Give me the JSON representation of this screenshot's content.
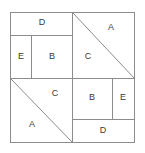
{
  "figure": {
    "background_color": "#ffffff",
    "line_color": "#8c8c8c",
    "label_color": "#3a3a3a",
    "frame": {
      "x": 10,
      "y": 12,
      "width": 125,
      "height": 131
    },
    "center": {
      "x": 72,
      "y": 78
    }
  },
  "quadrants": [
    {
      "name": "top-left",
      "pieces": [
        {
          "id": "tl-D",
          "label": "D",
          "x": 42,
          "y": 23
        },
        {
          "id": "tl-E",
          "label": "E",
          "x": 21,
          "y": 57
        },
        {
          "id": "tl-B",
          "label": "B",
          "x": 52,
          "y": 57
        }
      ]
    },
    {
      "name": "top-right",
      "pieces": [
        {
          "id": "tr-A",
          "label": "A",
          "x": 111,
          "y": 28
        },
        {
          "id": "tr-C",
          "label": "C",
          "x": 88,
          "y": 57
        }
      ]
    },
    {
      "name": "bottom-left",
      "pieces": [
        {
          "id": "bl-C",
          "label": "C",
          "x": 55,
          "y": 94
        },
        {
          "id": "bl-A",
          "label": "A",
          "x": 32,
          "y": 125
        }
      ]
    },
    {
      "name": "bottom-right",
      "pieces": [
        {
          "id": "br-B",
          "label": "B",
          "x": 92,
          "y": 98
        },
        {
          "id": "br-E",
          "label": "E",
          "x": 123,
          "y": 98
        },
        {
          "id": "br-D",
          "label": "D",
          "x": 103,
          "y": 131
        }
      ]
    }
  ],
  "cut_lines": {
    "straight": [
      {
        "id": "center-vertical",
        "x1": 72,
        "y1": 12,
        "x2": 72,
        "y2": 143
      },
      {
        "id": "center-horizontal",
        "x1": 10,
        "y1": 78,
        "x2": 135,
        "y2": 78
      },
      {
        "id": "tl-D-bottom",
        "x1": 10,
        "y1": 35,
        "x2": 72,
        "y2": 35
      },
      {
        "id": "tl-E-B-divider",
        "x1": 31,
        "y1": 35,
        "x2": 31,
        "y2": 78
      },
      {
        "id": "br-D-top",
        "x1": 72,
        "y1": 119,
        "x2": 135,
        "y2": 119
      },
      {
        "id": "br-B-E-divider",
        "x1": 112,
        "y1": 78,
        "x2": 112,
        "y2": 119
      }
    ],
    "diagonal": [
      {
        "id": "tr-diagonal",
        "x1": 72,
        "y1": 12,
        "x2": 135,
        "y2": 78
      },
      {
        "id": "bl-diagonal",
        "x1": 10,
        "y1": 78,
        "x2": 72,
        "y2": 143
      }
    ]
  }
}
